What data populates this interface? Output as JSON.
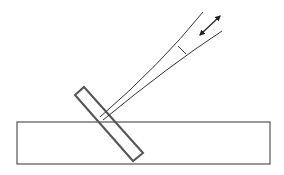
{
  "diagram": {
    "colors": {
      "stroke": "#333333",
      "tilted_probe": "#555555",
      "background": "#ffffff"
    },
    "elements": {
      "slab": {
        "label": ""
      },
      "probe": {
        "label": ""
      },
      "upper_line": {
        "label": ""
      },
      "lower_line": {
        "label": ""
      },
      "cross_tick": {
        "label": ""
      },
      "arrow": {
        "label": "",
        "direction": "bidirectional"
      }
    }
  }
}
